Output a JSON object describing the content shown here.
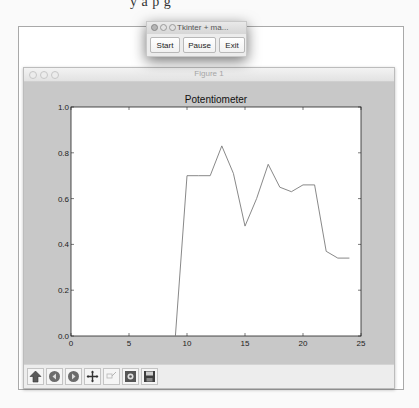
{
  "background_text": "y    a    p g",
  "tk_window": {
    "title": "Tkinter + ma...",
    "buttons": [
      {
        "label": "Start"
      },
      {
        "label": "Pause"
      },
      {
        "label": "Exit"
      }
    ]
  },
  "figure_window": {
    "title": "Figure 1",
    "toolbar": [
      {
        "icon": "home-icon",
        "tooltip": "Home"
      },
      {
        "icon": "back-icon",
        "tooltip": "Back"
      },
      {
        "icon": "forward-icon",
        "tooltip": "Forward"
      },
      {
        "icon": "pan-icon",
        "tooltip": "Pan"
      },
      {
        "icon": "zoom-icon",
        "tooltip": "Zoom"
      },
      {
        "icon": "configure-subplots-icon",
        "tooltip": "Configure subplots"
      },
      {
        "icon": "save-icon",
        "tooltip": "Save"
      }
    ]
  },
  "chart_data": {
    "type": "line",
    "title": "Potentiometer",
    "xlabel": "",
    "ylabel": "",
    "xlim": [
      0,
      25
    ],
    "ylim": [
      0.0,
      1.0
    ],
    "xticks": [
      "0",
      "5",
      "10",
      "15",
      "20",
      "25"
    ],
    "yticks": [
      "0.0",
      "0.2",
      "0.4",
      "0.6",
      "0.8",
      "1.0"
    ],
    "grid": false,
    "legend": null,
    "series": [
      {
        "name": "potentiometer",
        "color": "#7a7a7a",
        "x": [
          9,
          10,
          11,
          12,
          13,
          14,
          15,
          16,
          17,
          18,
          19,
          20,
          21,
          22,
          23,
          24
        ],
        "values": [
          0.0,
          0.7,
          0.7,
          0.7,
          0.83,
          0.71,
          0.48,
          0.6,
          0.75,
          0.65,
          0.63,
          0.66,
          0.66,
          0.37,
          0.34,
          0.34
        ]
      }
    ]
  }
}
